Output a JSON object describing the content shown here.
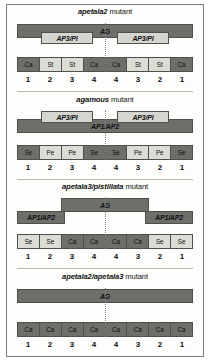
{
  "figure": {
    "caption_absent": true,
    "panels": [
      {
        "id": "panel-apetala2",
        "title_italic": "apetala2",
        "title_plain": " mutant",
        "genes": [
          {
            "name": "AG",
            "shade": "dark",
            "left": 0,
            "width": 176,
            "top": 0,
            "height": 14,
            "label_align": "center"
          },
          {
            "name": "AP3/PI",
            "shade": "light",
            "left": 24,
            "width": 52,
            "top": 8,
            "height": 12
          },
          {
            "name": "AP3/PI",
            "shade": "light",
            "left": 100,
            "width": 52,
            "top": 8,
            "height": 12
          }
        ],
        "organs": [
          {
            "label": "Ca",
            "shade": "dark"
          },
          {
            "label": "St",
            "shade": "light"
          },
          {
            "label": "St",
            "shade": "light"
          },
          {
            "label": "Ca",
            "shade": "dark"
          },
          {
            "label": "Ca",
            "shade": "dark"
          },
          {
            "label": "St",
            "shade": "light"
          },
          {
            "label": "St",
            "shade": "light"
          },
          {
            "label": "Ca",
            "shade": "dark"
          }
        ],
        "whorls": [
          "1",
          "2",
          "3",
          "4",
          "4",
          "3",
          "2",
          "1"
        ]
      },
      {
        "id": "panel-agamous",
        "title_italic": "agamous",
        "title_plain": " mutant",
        "genes": [
          {
            "name": "AP1/AP2",
            "shade": "dark",
            "left": 0,
            "width": 176,
            "top": 8,
            "height": 14,
            "label_align": "center"
          },
          {
            "name": "AP3/PI",
            "shade": "light",
            "left": 24,
            "width": 52,
            "top": 0,
            "height": 12
          },
          {
            "name": "AP3/PI",
            "shade": "light",
            "left": 100,
            "width": 52,
            "top": 0,
            "height": 12
          }
        ],
        "organs": [
          {
            "label": "Se",
            "shade": "dark"
          },
          {
            "label": "Pe",
            "shade": "light"
          },
          {
            "label": "Pe",
            "shade": "light"
          },
          {
            "label": "Se",
            "shade": "dark"
          },
          {
            "label": "Se",
            "shade": "dark"
          },
          {
            "label": "Pe",
            "shade": "light"
          },
          {
            "label": "Pe",
            "shade": "light"
          },
          {
            "label": "Se",
            "shade": "dark"
          }
        ],
        "whorls": [
          "1",
          "2",
          "3",
          "4",
          "4",
          "3",
          "2",
          "1"
        ]
      },
      {
        "id": "panel-apetala3-pistillata",
        "title_italic": "apetala3/pistillata",
        "title_plain": " mutant",
        "genes": [
          {
            "name": "AG",
            "shade": "dark",
            "left": 44,
            "width": 88,
            "top": 0,
            "height": 14,
            "label_align": "center"
          },
          {
            "name": "AP1/AP2",
            "shade": "dark",
            "left": 0,
            "width": 48,
            "top": 13,
            "height": 13
          },
          {
            "name": "AP1/AP2",
            "shade": "dark",
            "left": 128,
            "width": 48,
            "top": 13,
            "height": 13
          }
        ],
        "organs": [
          {
            "label": "Se",
            "shade": "light"
          },
          {
            "label": "Se",
            "shade": "light"
          },
          {
            "label": "Ca",
            "shade": "dark"
          },
          {
            "label": "Ca",
            "shade": "dark"
          },
          {
            "label": "Ca",
            "shade": "dark"
          },
          {
            "label": "Ca",
            "shade": "dark"
          },
          {
            "label": "Se",
            "shade": "light"
          },
          {
            "label": "Se",
            "shade": "light"
          }
        ],
        "whorls": [
          "1",
          "2",
          "3",
          "4",
          "4",
          "3",
          "2",
          "1"
        ]
      },
      {
        "id": "panel-apetala2-apetala3",
        "title_italic": "apetala2/apetala3",
        "title_plain": " mutant",
        "genes": [
          {
            "name": "AG",
            "shade": "dark",
            "left": 0,
            "width": 176,
            "top": 0,
            "height": 14,
            "label_align": "center"
          }
        ],
        "organs": [
          {
            "label": "Ca",
            "shade": "dark"
          },
          {
            "label": "Ca",
            "shade": "dark"
          },
          {
            "label": "Ca",
            "shade": "dark"
          },
          {
            "label": "Ca",
            "shade": "dark"
          },
          {
            "label": "Ca",
            "shade": "dark"
          },
          {
            "label": "Ca",
            "shade": "dark"
          },
          {
            "label": "Ca",
            "shade": "dark"
          },
          {
            "label": "Ca",
            "shade": "dark"
          }
        ],
        "whorls": [
          "1",
          "2",
          "3",
          "4",
          "4",
          "3",
          "2",
          "1"
        ]
      }
    ]
  },
  "colors": {
    "dark_band": "#6e6e6a",
    "light_band": "#d6d6d0",
    "organ_dark": "#6e6e6a",
    "organ_light": "#dcdcd6",
    "outline": "#4f4f4c",
    "frame": "#7d7d78",
    "midline": "#8a8a85",
    "text": "#101010",
    "page": "#fdfdfb"
  }
}
